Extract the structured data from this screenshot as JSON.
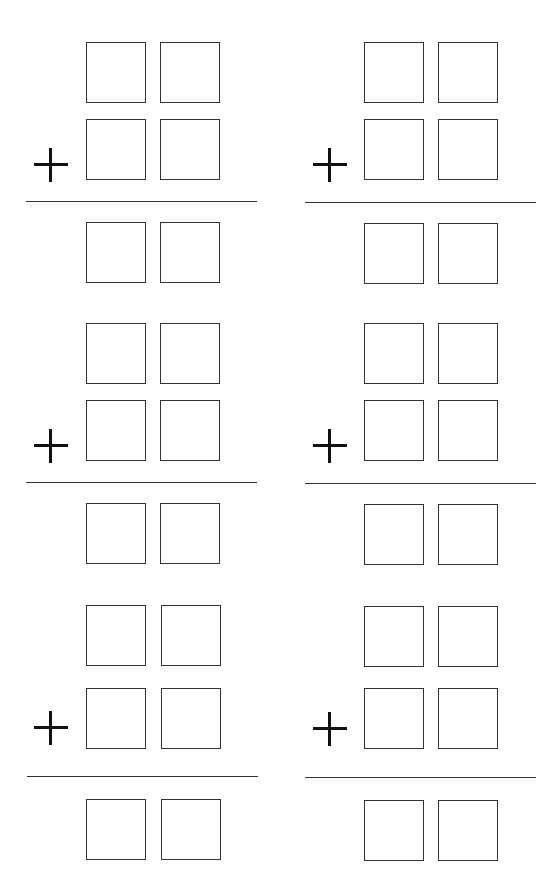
{
  "worksheet": {
    "type": "two-digit addition",
    "operator": "+",
    "problems": [
      {
        "id": 1,
        "operator": "+",
        "digits_per_row": 2,
        "rows": 2,
        "answer_digits": 2
      },
      {
        "id": 2,
        "operator": "+",
        "digits_per_row": 2,
        "rows": 2,
        "answer_digits": 2
      },
      {
        "id": 3,
        "operator": "+",
        "digits_per_row": 2,
        "rows": 2,
        "answer_digits": 2
      },
      {
        "id": 4,
        "operator": "+",
        "digits_per_row": 2,
        "rows": 2,
        "answer_digits": 2
      },
      {
        "id": 5,
        "operator": "+",
        "digits_per_row": 2,
        "rows": 2,
        "answer_digits": 2
      },
      {
        "id": 6,
        "operator": "+",
        "digits_per_row": 2,
        "rows": 2,
        "answer_digits": 2
      }
    ]
  },
  "colors": {
    "stroke": "#333333",
    "background": "#ffffff"
  }
}
